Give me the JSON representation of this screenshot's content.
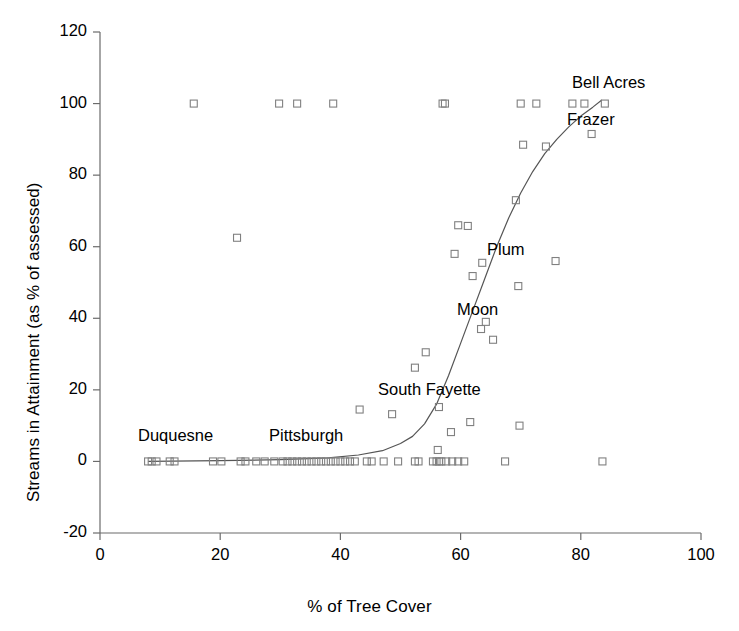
{
  "chart_data": {
    "type": "scatter",
    "title": "",
    "xlabel": "% of Tree Cover",
    "ylabel": "Streams in Attainment (as % of assessed)",
    "xlim": [
      0,
      100
    ],
    "ylim": [
      -20,
      120
    ],
    "xticks": [
      0,
      20,
      40,
      60,
      80,
      100
    ],
    "yticks": [
      -20,
      0,
      20,
      40,
      60,
      80,
      100,
      120
    ],
    "grid": false,
    "legend": null,
    "marker": "open-square",
    "marker_color": "#808080",
    "series": [
      {
        "name": "Municipalities",
        "points": [
          [
            8.0,
            0
          ],
          [
            8.6,
            0
          ],
          [
            9.4,
            0
          ],
          [
            11.6,
            0
          ],
          [
            12.4,
            0
          ],
          [
            15.6,
            100
          ],
          [
            22.8,
            62.5
          ],
          [
            18.8,
            0
          ],
          [
            20.2,
            0
          ],
          [
            23.4,
            0
          ],
          [
            24.2,
            0
          ],
          [
            29.8,
            100
          ],
          [
            32.8,
            100
          ],
          [
            38.8,
            100
          ],
          [
            26.0,
            0
          ],
          [
            27.4,
            0
          ],
          [
            29.0,
            0
          ],
          [
            30.4,
            0
          ],
          [
            31.2,
            0
          ],
          [
            32.0,
            0
          ],
          [
            32.8,
            0
          ],
          [
            33.6,
            0
          ],
          [
            34.4,
            0
          ],
          [
            35.2,
            0
          ],
          [
            36.0,
            0
          ],
          [
            36.8,
            0
          ],
          [
            37.6,
            0
          ],
          [
            38.4,
            0
          ],
          [
            39.2,
            0
          ],
          [
            40.0,
            0
          ],
          [
            40.8,
            0
          ],
          [
            41.6,
            0
          ],
          [
            42.4,
            0
          ],
          [
            43.2,
            14.5
          ],
          [
            48.6,
            13.2
          ],
          [
            44.4,
            0
          ],
          [
            45.2,
            0
          ],
          [
            47.2,
            0
          ],
          [
            49.6,
            0
          ],
          [
            52.4,
            0
          ],
          [
            53.0,
            0
          ],
          [
            55.4,
            0
          ],
          [
            56.0,
            0
          ],
          [
            56.4,
            0
          ],
          [
            56.8,
            0
          ],
          [
            57.6,
            0
          ],
          [
            58.6,
            0
          ],
          [
            59.6,
            0
          ],
          [
            60.6,
            0
          ],
          [
            56.2,
            3.2
          ],
          [
            56.4,
            15.2
          ],
          [
            57.4,
            100
          ],
          [
            57.0,
            100
          ],
          [
            54.2,
            30.5
          ],
          [
            52.4,
            26.2
          ],
          [
            58.4,
            8.2
          ],
          [
            59.6,
            66.0
          ],
          [
            59.0,
            58.0
          ],
          [
            61.6,
            11.0
          ],
          [
            62.0,
            51.8
          ],
          [
            61.2,
            65.8
          ],
          [
            63.4,
            37.0
          ],
          [
            64.2,
            39.0
          ],
          [
            63.6,
            55.5
          ],
          [
            65.4,
            34.0
          ],
          [
            67.4,
            0
          ],
          [
            69.8,
            10.0
          ],
          [
            69.6,
            49.0
          ],
          [
            69.2,
            73.0
          ],
          [
            70.4,
            88.5
          ],
          [
            70.0,
            100
          ],
          [
            72.6,
            100
          ],
          [
            74.2,
            88.0
          ],
          [
            75.8,
            56.0
          ],
          [
            78.6,
            100
          ],
          [
            80.6,
            100
          ],
          [
            81.8,
            91.5
          ],
          [
            84.0,
            100
          ],
          [
            83.6,
            0
          ]
        ]
      }
    ],
    "fit_curve": {
      "name": "logistic-fit",
      "color": "#555555",
      "points": [
        [
          8.0,
          0
        ],
        [
          20.0,
          0.2
        ],
        [
          30.0,
          0.5
        ],
        [
          38.0,
          1.0
        ],
        [
          43.0,
          1.8
        ],
        [
          47.0,
          3.0
        ],
        [
          50.0,
          5.0
        ],
        [
          52.0,
          7.0
        ],
        [
          54.0,
          10.5
        ],
        [
          56.0,
          16.0
        ],
        [
          58.0,
          24.0
        ],
        [
          60.0,
          33.0
        ],
        [
          62.0,
          42.0
        ],
        [
          64.0,
          51.0
        ],
        [
          66.0,
          60.0
        ],
        [
          68.0,
          68.0
        ],
        [
          70.0,
          75.0
        ],
        [
          72.0,
          81.0
        ],
        [
          74.0,
          86.0
        ],
        [
          76.0,
          90.0
        ],
        [
          78.0,
          93.5
        ],
        [
          80.0,
          96.5
        ],
        [
          82.0,
          99.0
        ],
        [
          83.5,
          101.0
        ]
      ]
    },
    "annotations": [
      {
        "text": "Duquesne",
        "x_px": 138,
        "y_px": 426
      },
      {
        "text": "Pittsburgh",
        "x_px": 269,
        "y_px": 426
      },
      {
        "text": "South Fayette",
        "x_px": 378,
        "y_px": 380
      },
      {
        "text": "Moon",
        "x_px": 457,
        "y_px": 300
      },
      {
        "text": "Plum",
        "x_px": 487,
        "y_px": 240
      },
      {
        "text": "Frazer",
        "x_px": 567,
        "y_px": 110
      },
      {
        "text": "Bell Acres",
        "x_px": 572,
        "y_px": 73
      }
    ]
  },
  "axes": {
    "x_title": "% of Tree Cover",
    "y_title": "Streams in Attainment (as % of assessed)",
    "x_tick_labels": [
      "0",
      "20",
      "40",
      "60",
      "80",
      "100"
    ],
    "y_tick_labels": [
      "120",
      "100",
      "80",
      "60",
      "40",
      "20",
      "0",
      "-20"
    ],
    "axis_color": "#6b6b6b"
  }
}
